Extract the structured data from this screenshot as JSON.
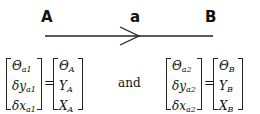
{
  "diagram": {
    "labels": {
      "left": "A",
      "middle": "a",
      "right": "B"
    },
    "arrow": {
      "direction": "right"
    }
  },
  "equations": {
    "connector": "and",
    "equals": "=",
    "eq1": {
      "lhs": [
        {
          "base": "Θ",
          "sub": "a1"
        },
        {
          "base": "δy",
          "sub": "a1"
        },
        {
          "base": "δx",
          "sub": "a1"
        }
      ],
      "rhs": [
        {
          "base": "Θ",
          "sub": "A"
        },
        {
          "base": "Y",
          "sub": "A"
        },
        {
          "base": "X",
          "sub": "A"
        }
      ]
    },
    "eq2": {
      "lhs": [
        {
          "base": "Θ",
          "sub": "a2"
        },
        {
          "base": "δy",
          "sub": "a2"
        },
        {
          "base": "δx",
          "sub": "a2"
        }
      ],
      "rhs": [
        {
          "base": "Θ",
          "sub": "B"
        },
        {
          "base": "Y",
          "sub": "B"
        },
        {
          "base": "X",
          "sub": "B"
        }
      ]
    }
  }
}
